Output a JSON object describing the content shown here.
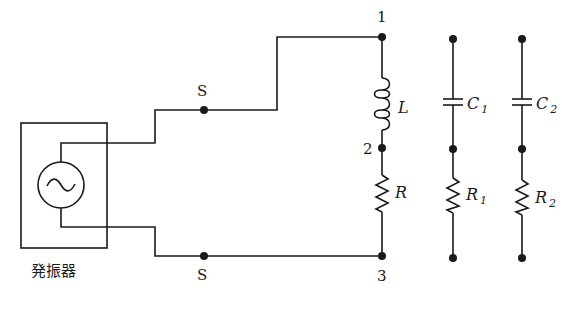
{
  "diagram": {
    "type": "circuit-schematic",
    "oscillator": {
      "label": "発振器",
      "symbol": "~"
    },
    "switch_terminals": [
      {
        "id": "S_top",
        "label": "S"
      },
      {
        "id": "S_bottom",
        "label": "S"
      }
    ],
    "nodes": [
      {
        "id": "1",
        "label": "1"
      },
      {
        "id": "2",
        "label": "2"
      },
      {
        "id": "3",
        "label": "3"
      }
    ],
    "main_branch": {
      "inductor": {
        "label": "L"
      },
      "resistor": {
        "label": "R"
      }
    },
    "spare_branches": [
      {
        "capacitor": {
          "label": "C",
          "sub": "1"
        },
        "resistor": {
          "label": "R",
          "sub": "1"
        }
      },
      {
        "capacitor": {
          "label": "C",
          "sub": "2"
        },
        "resistor": {
          "label": "R",
          "sub": "2"
        }
      }
    ]
  }
}
